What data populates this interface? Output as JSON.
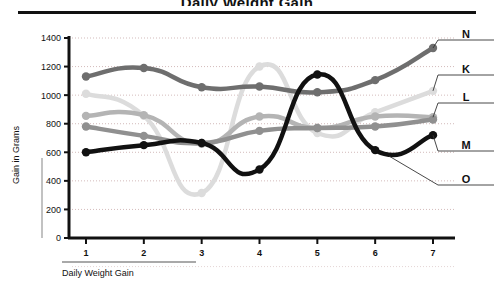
{
  "figure": {
    "cutoff_title": "Daily Weight Gain",
    "y_axis_title": "Gain in Grams",
    "x_axis_title": "Daily Weight Gain"
  },
  "chart_data": {
    "type": "line",
    "title": "",
    "xlabel": "Daily Weight Gain",
    "ylabel": "Gain in Grams",
    "x": [
      1,
      2,
      3,
      4,
      5,
      6,
      7
    ],
    "categories": [
      "1",
      "2",
      "3",
      "4",
      "5",
      "6",
      "7"
    ],
    "xlim": [
      0.6,
      7.4
    ],
    "ylim": [
      0,
      1400
    ],
    "yticks": [
      0,
      200,
      400,
      600,
      800,
      1000,
      1200,
      1400
    ],
    "ytick_labels": [
      "0",
      "200",
      "400",
      "600",
      "800",
      "1000",
      "1200",
      "1400"
    ],
    "grid": "horizontal-dotted",
    "legend": "right-of-plot-with-leader-lines",
    "series": [
      {
        "name": "N",
        "label": "N",
        "color": "#6e6e6e",
        "values": [
          1130,
          1190,
          1055,
          1060,
          1020,
          1105,
          1330
        ],
        "markers": true
      },
      {
        "name": "K",
        "label": "K",
        "color": "#dcdcdc",
        "values": [
          1010,
          855,
          315,
          1200,
          735,
          880,
          1030
        ],
        "markers": true
      },
      {
        "name": "L",
        "label": "L",
        "color": "#b4b4b4",
        "values": [
          855,
          860,
          660,
          850,
          770,
          850,
          845
        ],
        "markers": true
      },
      {
        "name": "M",
        "label": "M",
        "color": "#909090",
        "values": [
          780,
          715,
          665,
          750,
          770,
          780,
          830
        ],
        "markers": true
      },
      {
        "name": "O",
        "label": "O",
        "color": "#111111",
        "values": [
          600,
          650,
          665,
          480,
          1145,
          615,
          720
        ],
        "markers": true
      }
    ]
  }
}
